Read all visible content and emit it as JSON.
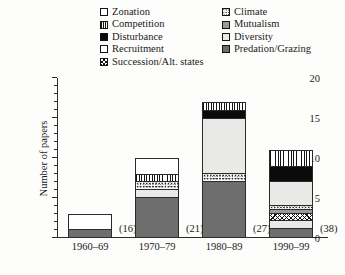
{
  "chart_data": {
    "type": "bar",
    "stacked": true,
    "title": "",
    "xlabel": "",
    "ylabel": "Number of papers",
    "ylim": [
      0,
      20
    ],
    "ytick_labels": [
      "0",
      "5",
      "10",
      "15",
      "20"
    ],
    "ytick_values": [
      0,
      5,
      10,
      15,
      20
    ],
    "minor_tick_step": 1,
    "grid": false,
    "legend_position": "top",
    "categories": [
      "1960–69",
      "1970–79",
      "1980–89",
      "1990–99"
    ],
    "category_counts": [
      "(16)",
      "(21)",
      "(27)",
      "(38)"
    ],
    "series": [
      {
        "name": "Predation/Grazing",
        "pattern": "dark-gray",
        "values": [
          1,
          5,
          7,
          1
        ]
      },
      {
        "name": "Diversity",
        "pattern": "light-gray",
        "values": [
          0,
          1,
          0,
          1
        ]
      },
      {
        "name": "Succession/Alt. states",
        "pattern": "crosshatch",
        "values": [
          0,
          0,
          0,
          1
        ]
      },
      {
        "name": "Mutualism",
        "pattern": "mid-gray",
        "values": [
          0,
          0,
          0,
          0.5
        ]
      },
      {
        "name": "Climate",
        "pattern": "speckled",
        "values": [
          0,
          1,
          1,
          0.5
        ]
      },
      {
        "name": "Diversity (upper)",
        "pattern": "light-gray",
        "values": [
          0,
          0,
          7,
          3
        ]
      },
      {
        "name": "Disturbance",
        "pattern": "black",
        "values": [
          0,
          0,
          1,
          2
        ]
      },
      {
        "name": "Competition",
        "pattern": "vertical-stripes",
        "values": [
          0,
          1,
          1,
          2
        ]
      },
      {
        "name": "Zonation",
        "pattern": "white",
        "values": [
          2,
          2,
          0,
          0
        ]
      }
    ],
    "totals": [
      3,
      10,
      17,
      11
    ]
  },
  "legend": {
    "left_column": [
      {
        "label": "Zonation",
        "pattern": "white"
      },
      {
        "label": "Competition",
        "pattern": "vertical-stripes"
      },
      {
        "label": "Disturbance",
        "pattern": "black"
      },
      {
        "label": "Recruitment",
        "pattern": "white"
      },
      {
        "label": "Succession/Alt. states",
        "pattern": "crosshatch"
      }
    ],
    "right_column": [
      {
        "label": "Climate",
        "pattern": "speckled"
      },
      {
        "label": "Mutualism",
        "pattern": "mid-gray"
      },
      {
        "label": "Diversity",
        "pattern": "light-gray"
      },
      {
        "label": "Predation/Grazing",
        "pattern": "dark-gray"
      }
    ]
  },
  "colors": {
    "axis": "#2b2b2b",
    "dark_gray": "#6e6e6e",
    "mid_gray": "#9a9a9a",
    "light_gray": "#e9e9e7",
    "black": "#0b0b0b",
    "white": "#ffffff",
    "background": "#fdfdfc"
  }
}
